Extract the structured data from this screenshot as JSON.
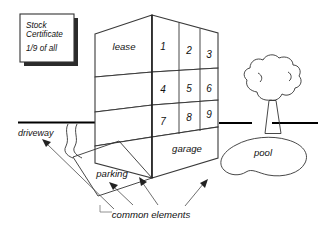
{
  "diagram": {
    "title_elements": {
      "certificate": {
        "line1": "Stock",
        "line2": "Certificate",
        "line3": "1/9 of all"
      }
    },
    "building": {
      "left_face_label": "lease",
      "base_label": "garage",
      "units": [
        "1",
        "2",
        "3",
        "4",
        "5",
        "6",
        "7",
        "8",
        "9"
      ]
    },
    "site": {
      "driveway_label": "driveway",
      "parking_label": "parking",
      "pool_label": "pool",
      "common_label": "common  elements"
    },
    "colors": {
      "ink": "#111111",
      "line": "#333333",
      "ground": "#000000",
      "paper": "#ffffff"
    }
  }
}
